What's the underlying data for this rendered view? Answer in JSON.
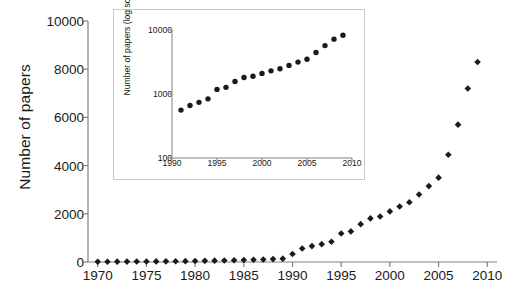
{
  "chart_data": [
    {
      "id": "main",
      "type": "scatter",
      "title": "",
      "xlabel": "",
      "ylabel": "Number of papers",
      "xlim": [
        1969,
        2011
      ],
      "ylim": [
        0,
        10000
      ],
      "xticks": [
        1970,
        1975,
        1980,
        1985,
        1990,
        1995,
        2000,
        2005,
        2010
      ],
      "yticks": [
        0,
        2000,
        4000,
        6000,
        8000,
        10000
      ],
      "grid": false,
      "legend": "none",
      "marker": "diamond",
      "marker_color": "#1a1a1a",
      "axis_color": "#808080",
      "x": [
        1970,
        1971,
        1972,
        1973,
        1974,
        1975,
        1976,
        1977,
        1978,
        1979,
        1980,
        1981,
        1982,
        1983,
        1984,
        1985,
        1986,
        1987,
        1988,
        1989,
        1990,
        1991,
        1992,
        1993,
        1994,
        1995,
        1996,
        1997,
        1998,
        1999,
        2000,
        2001,
        2002,
        2003,
        2004,
        2005,
        2006,
        2007,
        2008,
        2009
      ],
      "values": [
        10,
        12,
        14,
        16,
        18,
        20,
        24,
        28,
        32,
        36,
        42,
        48,
        55,
        62,
        70,
        80,
        92,
        105,
        120,
        140,
        330,
        560,
        660,
        740,
        840,
        1180,
        1270,
        1570,
        1810,
        1890,
        2100,
        2300,
        2480,
        2800,
        3150,
        3500,
        4450,
        5700,
        7200,
        8300
      ]
    },
    {
      "id": "inset",
      "type": "scatter",
      "title": "",
      "xlabel": "",
      "ylabel": "Number of papers (log scale)",
      "xlim": [
        1990,
        2010
      ],
      "ylim": [
        100,
        10000
      ],
      "yscale": "log",
      "xticks": [
        1990,
        1995,
        2000,
        2005,
        2010
      ],
      "yticks": [
        100,
        1000,
        10000
      ],
      "grid": false,
      "legend": "none",
      "marker": "circle",
      "marker_color": "#1a1a1a",
      "axis_color": "#808080",
      "x": [
        1991,
        1992,
        1993,
        1994,
        1995,
        1996,
        1997,
        1998,
        1999,
        2000,
        2001,
        2002,
        2003,
        2004,
        2005,
        2006,
        2007,
        2008,
        2009
      ],
      "values": [
        560,
        660,
        740,
        840,
        1180,
        1270,
        1570,
        1810,
        1890,
        2100,
        2300,
        2480,
        2800,
        3150,
        3500,
        4450,
        5700,
        7200,
        8300
      ]
    }
  ],
  "main": {
    "ylabel": "Number of papers",
    "ytick_labels": [
      "0",
      "2000",
      "4000",
      "6000",
      "8000",
      "10000"
    ],
    "xtick_labels": [
      "1970",
      "1975",
      "1980",
      "1985",
      "1990",
      "1995",
      "2000",
      "2005",
      "2010"
    ]
  },
  "inset": {
    "ylabel": "Number of papers (log scale)",
    "ytick_labels": [
      "100",
      "1000",
      "10000"
    ],
    "xtick_labels": [
      "1990",
      "1995",
      "2000",
      "2005",
      "2010"
    ]
  }
}
